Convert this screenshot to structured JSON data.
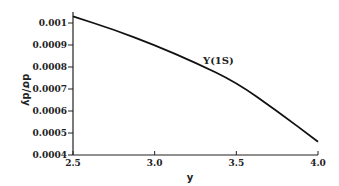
{
  "chart_data": {
    "type": "line",
    "title": "",
    "xlabel": "y",
    "ylabel": "dσ/dy",
    "xlim": [
      2.5,
      4.0
    ],
    "ylim": [
      0.0004,
      0.00105
    ],
    "xticks": [
      "2.5",
      "3.0",
      "3.5",
      "4.0"
    ],
    "yticks": [
      "0.0004",
      "0.0005",
      "0.0006",
      "0.0007",
      "0.0008",
      "0.0009",
      "0.001"
    ],
    "grid": false,
    "series": [
      {
        "name": "Y(1S)",
        "x": [
          2.5,
          2.75,
          3.0,
          3.25,
          3.5,
          3.75,
          4.0
        ],
        "y": [
          0.00103,
          0.00097,
          0.0009,
          0.00082,
          0.00073,
          0.0006,
          0.00046
        ]
      }
    ]
  }
}
